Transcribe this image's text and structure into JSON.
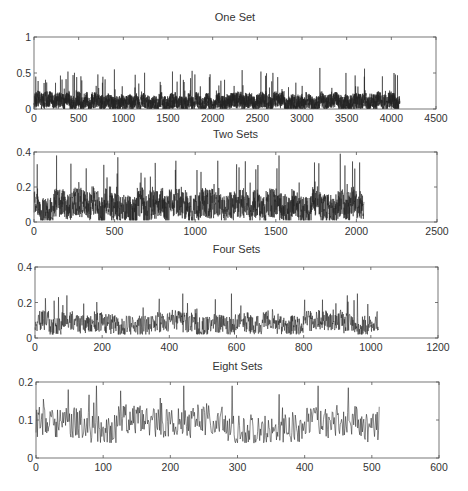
{
  "figure": {
    "width": 468,
    "height": 491,
    "background": "#ffffff",
    "trace_color": "#222222",
    "axis_color": "#555555"
  },
  "chart_data": [
    {
      "type": "line",
      "title": "One Set",
      "xlabel": "",
      "ylabel": "",
      "xlim": [
        0,
        4500
      ],
      "ylim": [
        0,
        1
      ],
      "xticks": [
        0,
        500,
        1000,
        1500,
        2000,
        2500,
        3000,
        3500,
        4000,
        4500
      ],
      "xtick_labels": [
        "0",
        "500",
        "1000",
        "1500",
        "2000",
        "2500",
        "3000",
        "3500",
        "4000",
        "4500"
      ],
      "yticks": [
        0,
        0.5,
        1
      ],
      "ytick_labels": [
        "0",
        "0.5",
        "1"
      ],
      "grid": false,
      "n_points": 4096,
      "series_stats": {
        "mean": 0.1,
        "typical_min": 0.0,
        "typical_max": 0.25,
        "spike_max": 0.57
      },
      "notable_peaks": [
        {
          "x": 20,
          "y": 0.45
        },
        {
          "x": 380,
          "y": 0.52
        },
        {
          "x": 900,
          "y": 0.55
        },
        {
          "x": 1550,
          "y": 0.52
        },
        {
          "x": 1770,
          "y": 0.53
        },
        {
          "x": 2330,
          "y": 0.54
        },
        {
          "x": 2540,
          "y": 0.52
        },
        {
          "x": 3200,
          "y": 0.57
        },
        {
          "x": 3700,
          "y": 0.56
        },
        {
          "x": 4030,
          "y": 0.5
        }
      ],
      "box": {
        "x0": 34,
        "y0": 37,
        "x1": 436,
        "y1": 109
      },
      "title_y": 21
    },
    {
      "type": "line",
      "title": "Two Sets",
      "xlabel": "",
      "ylabel": "",
      "xlim": [
        0,
        2500
      ],
      "ylim": [
        0,
        0.4
      ],
      "xticks": [
        0,
        500,
        1000,
        1500,
        2000,
        2500
      ],
      "xtick_labels": [
        "0",
        "500",
        "1000",
        "1500",
        "2000",
        "2500"
      ],
      "yticks": [
        0,
        0.2,
        0.4
      ],
      "ytick_labels": [
        "0",
        "0.2",
        "0.4"
      ],
      "grid": false,
      "n_points": 2048,
      "series_stats": {
        "mean": 0.09,
        "typical_min": 0.01,
        "typical_max": 0.2,
        "spike_max": 0.39
      },
      "notable_peaks": [
        {
          "x": 20,
          "y": 0.33
        },
        {
          "x": 140,
          "y": 0.38
        },
        {
          "x": 520,
          "y": 0.37
        },
        {
          "x": 880,
          "y": 0.35
        },
        {
          "x": 1140,
          "y": 0.35
        },
        {
          "x": 1520,
          "y": 0.38
        },
        {
          "x": 1740,
          "y": 0.34
        },
        {
          "x": 1900,
          "y": 0.39
        },
        {
          "x": 2020,
          "y": 0.34
        }
      ],
      "box": {
        "x0": 34,
        "y0": 152,
        "x1": 437,
        "y1": 222
      },
      "title_y": 138
    },
    {
      "type": "line",
      "title": "Four Sets",
      "xlabel": "",
      "ylabel": "",
      "xlim": [
        0,
        1200
      ],
      "ylim": [
        0,
        0.4
      ],
      "xticks": [
        0,
        200,
        400,
        600,
        800,
        1000,
        1200
      ],
      "xtick_labels": [
        "0",
        "200",
        "400",
        "600",
        "800",
        "1000",
        "1200"
      ],
      "yticks": [
        0,
        0.2,
        0.4
      ],
      "ytick_labels": [
        "0",
        "0.2",
        "0.4"
      ],
      "grid": false,
      "n_points": 1024,
      "series_stats": {
        "mean": 0.085,
        "typical_min": 0.02,
        "typical_max": 0.15,
        "spike_max": 0.25
      },
      "notable_peaks": [
        {
          "x": 70,
          "y": 0.23
        },
        {
          "x": 95,
          "y": 0.24
        },
        {
          "x": 440,
          "y": 0.25
        },
        {
          "x": 585,
          "y": 0.25
        },
        {
          "x": 930,
          "y": 0.24
        },
        {
          "x": 960,
          "y": 0.25
        }
      ],
      "box": {
        "x0": 35,
        "y0": 267,
        "x1": 438,
        "y1": 338
      },
      "title_y": 253
    },
    {
      "type": "line",
      "title": "Eight Sets",
      "xlabel": "",
      "ylabel": "",
      "xlim": [
        0,
        600
      ],
      "ylim": [
        0,
        0.2
      ],
      "xticks": [
        0,
        100,
        200,
        300,
        400,
        500,
        600
      ],
      "xtick_labels": [
        "0",
        "100",
        "200",
        "300",
        "400",
        "500",
        "600"
      ],
      "yticks": [
        0,
        0.1,
        0.2
      ],
      "ytick_labels": [
        "0",
        "0.1",
        "0.2"
      ],
      "grid": false,
      "n_points": 512,
      "series_stats": {
        "mean": 0.085,
        "typical_min": 0.04,
        "typical_max": 0.13,
        "spike_max": 0.19
      },
      "notable_peaks": [
        {
          "x": 48,
          "y": 0.18
        },
        {
          "x": 90,
          "y": 0.19
        },
        {
          "x": 220,
          "y": 0.195
        },
        {
          "x": 292,
          "y": 0.195
        },
        {
          "x": 420,
          "y": 0.195
        },
        {
          "x": 465,
          "y": 0.185
        }
      ],
      "box": {
        "x0": 36,
        "y0": 382,
        "x1": 439,
        "y1": 458
      },
      "title_y": 370
    }
  ]
}
